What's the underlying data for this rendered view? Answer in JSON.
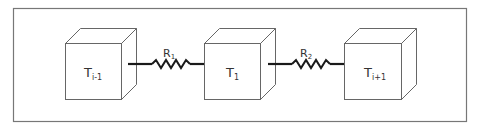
{
  "diagram": {
    "type": "thermal-resistance-network",
    "colors": {
      "frame": "#777777",
      "cube_edge": "#666666",
      "wire": "#1a1a1a",
      "text": "#333333"
    },
    "nodes": [
      {
        "id": "node-prev",
        "label_main": "T",
        "label_sub": "i-1"
      },
      {
        "id": "node-current",
        "label_main": "T",
        "label_sub": "1"
      },
      {
        "id": "node-next",
        "label_main": "T",
        "label_sub": "i+1"
      }
    ],
    "resistors": [
      {
        "id": "resistor-1",
        "label_main": "R",
        "label_sub": "1",
        "from": "node-prev",
        "to": "node-current"
      },
      {
        "id": "resistor-2",
        "label_main": "R",
        "label_sub": "2",
        "from": "node-current",
        "to": "node-next"
      }
    ]
  }
}
